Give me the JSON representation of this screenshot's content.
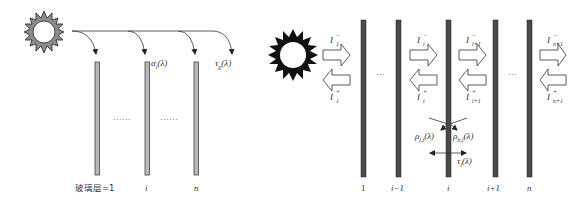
{
  "left_panel": {
    "title": "Transmission through glass layers",
    "sun_icon": "sun-gray",
    "labels": {
      "absorptance": "α",
      "absorptance_sub": "i",
      "absorptance_arg": "(λ)",
      "transmittance": "τ",
      "transmittance_sub": "g",
      "transmittance_arg": "(λ)",
      "ellipsis_1": "......",
      "ellipsis_2": "......"
    },
    "layer_labels": [
      "玻璃层=1",
      "i",
      "n"
    ]
  },
  "right_panel": {
    "sun_icon": "sun-black",
    "flux_labels": {
      "I1_minus": {
        "base": "I",
        "sup": "−",
        "sub": "1"
      },
      "I1_plus": {
        "base": "I",
        "sup": "+",
        "sub": "1"
      },
      "Ii_minus": {
        "base": "I",
        "sup": "−",
        "sub": "i"
      },
      "Ii_plus": {
        "base": "I",
        "sup": "+",
        "sub": "i"
      },
      "Ii1_minus": {
        "base": "I",
        "sup": "−",
        "sub": "i+1"
      },
      "Ii1_plus": {
        "base": "I",
        "sup": "+",
        "sub": "i+1"
      },
      "In1_minus": {
        "base": "I",
        "sup": "−",
        "sub": "n+1"
      },
      "In1_plus": {
        "base": "I",
        "sup": "+",
        "sub": "n+1"
      }
    },
    "optical_labels": {
      "rho_f": {
        "base": "ρ",
        "sub": "f,i",
        "arg": "(λ)"
      },
      "rho_b": {
        "base": "ρ",
        "sub": "b,i",
        "arg": "(λ)"
      },
      "tau": {
        "base": "τ",
        "sub": "i",
        "arg": "(λ)"
      }
    },
    "ellipsis_1": "···",
    "ellipsis_2": "···",
    "layer_labels": [
      "1",
      "i−1",
      "i",
      "i+1",
      "n"
    ]
  },
  "colors": {
    "glass_fill_left": "#b8b8b8",
    "glass_stroke_left": "#444444",
    "glass_fill_right": "#4a4a4a",
    "sun_left_fill": "#8c8c8c",
    "sun_right_fill": "#111111",
    "line": "#333333"
  }
}
